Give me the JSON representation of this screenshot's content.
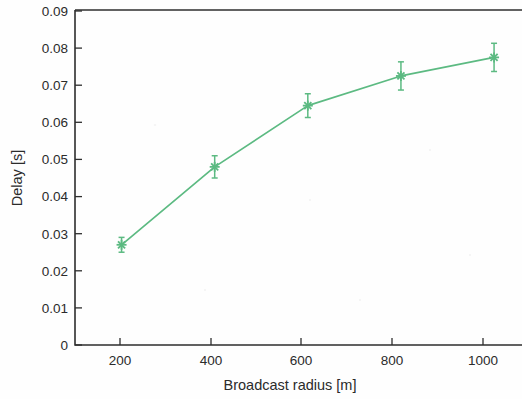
{
  "chart_data": {
    "type": "line",
    "title": "",
    "subtitle": "",
    "xlabel": "Broadcast radius [m]",
    "ylabel": "Delay [s]",
    "x": [
      200,
      400,
      600,
      800,
      1000
    ],
    "values": [
      0.027,
      0.048,
      0.0645,
      0.0725,
      0.0775
    ],
    "yerr": [
      0.002,
      0.003,
      0.0032,
      0.0038,
      0.0038
    ],
    "series": [
      {
        "name": "Delay",
        "values": [
          0.027,
          0.048,
          0.0645,
          0.0725,
          0.0775
        ],
        "yerr": [
          0.002,
          0.003,
          0.0032,
          0.0038,
          0.0038
        ],
        "color": "#5cba82",
        "marker": "star",
        "errorbars": true
      }
    ],
    "xlim": [
      100,
      1060
    ],
    "ylim": [
      0,
      0.09
    ],
    "xticks": [
      200,
      400,
      600,
      800,
      1000
    ],
    "xticklabels": [
      "200",
      "400",
      "600",
      "800",
      "1000"
    ],
    "yticks": [
      0,
      0.01,
      0.02,
      0.03,
      0.04,
      0.05,
      0.06,
      0.07,
      0.08,
      0.09
    ],
    "yticklabels": [
      "0",
      "0.01",
      "0.02",
      "0.03",
      "0.04",
      "0.05",
      "0.06",
      "0.07",
      "0.08",
      "0.09"
    ],
    "grid": false,
    "legend": null,
    "legend_position": "none",
    "annotations": []
  },
  "colors": {
    "series": "#5cba82",
    "axis": "#2e2e2e",
    "text": "#2b2b2b",
    "background": "#fefefe"
  },
  "axes": {
    "y_title": "Delay [s]",
    "x_title": "Broadcast radius [m]"
  }
}
